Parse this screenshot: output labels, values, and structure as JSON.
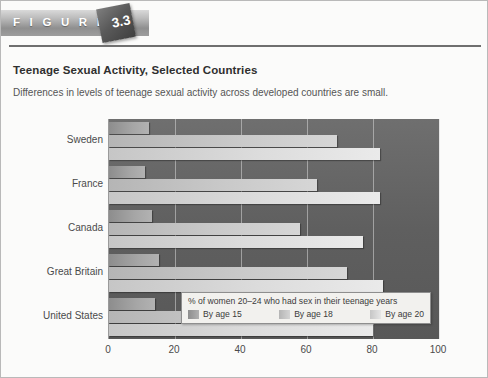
{
  "banner": {
    "word": "F I G U R E",
    "number": "3.3"
  },
  "heading": {
    "title": "Teenage Sexual Activity, Selected Countries",
    "subtitle": "Differences in levels of teenage sexual activity across developed countries are small."
  },
  "legend": {
    "title": "% of women 20–24 who had sex in their teenage years",
    "items": [
      {
        "label": "By age 15",
        "key": "s15"
      },
      {
        "label": "By age 18",
        "key": "s18"
      },
      {
        "label": "By age 20",
        "key": "s20"
      }
    ]
  },
  "colors": {
    "plot_background": "#5f5f5f",
    "page_background": "#fbfbfa",
    "rule": "#6f6f6f",
    "series_by_age_15": "#a6a6a6",
    "series_by_age_18": "#c9c9c9",
    "series_by_age_20": "#dcdcdc"
  },
  "chart_data": {
    "type": "bar",
    "orientation": "horizontal",
    "title": "Teenage Sexual Activity, Selected Countries",
    "subtitle": "Differences in levels of teenage sexual activity across developed countries are small.",
    "xlabel": "",
    "ylabel": "",
    "xlim": [
      0,
      100
    ],
    "xticks": [
      0,
      20,
      40,
      60,
      80,
      100
    ],
    "grid": true,
    "legend_position": "inside-bottom-right",
    "legend_title": "% of women 20–24 who had sex in their teenage years",
    "categories": [
      "Sweden",
      "France",
      "Canada",
      "Great Britain",
      "United States"
    ],
    "series": [
      {
        "name": "By age 15",
        "values": [
          12,
          11,
          13,
          15,
          14
        ]
      },
      {
        "name": "By age 18",
        "values": [
          69,
          63,
          58,
          72,
          68
        ]
      },
      {
        "name": "By age 20",
        "values": [
          82,
          82,
          77,
          83,
          80
        ]
      }
    ]
  }
}
